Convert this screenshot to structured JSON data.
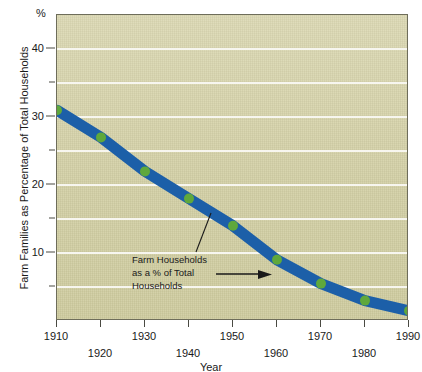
{
  "chart_data": {
    "type": "line",
    "title": "",
    "xlabel": "Year",
    "ylabel": "Farm Families as Percentage of Total Households",
    "unit_label": "%",
    "xlim": [
      1910,
      1990
    ],
    "ylim": [
      0,
      45
    ],
    "grid": true,
    "grid_values": [
      5,
      10,
      15,
      20,
      25,
      30,
      35,
      40
    ],
    "legend_position": "none",
    "x": [
      1910,
      1920,
      1930,
      1940,
      1950,
      1960,
      1970,
      1980,
      1990
    ],
    "series": [
      {
        "name": "Farm Households as a % of Total Households",
        "values": [
          31,
          27,
          22,
          18,
          14,
          9,
          5.5,
          3,
          1.5
        ],
        "line_color": "#1c5fa8",
        "marker_color": "#5fa83c"
      }
    ],
    "y_ticks_major": [
      10,
      20,
      30,
      40
    ],
    "y_ticks_minor": [
      5,
      15,
      25,
      35
    ],
    "y_tick_labels": [
      "10",
      "20",
      "30",
      "40"
    ],
    "x_ticks": [
      1910,
      1920,
      1930,
      1940,
      1950,
      1960,
      1970,
      1980,
      1990
    ],
    "x_tick_labels": [
      "1910",
      "1920",
      "1930",
      "1940",
      "1950",
      "1960",
      "1970",
      "1980",
      "1990"
    ],
    "annotations": [
      {
        "text_lines": [
          "Farm Households",
          "as a % of Total",
          "Households"
        ],
        "arrow": "right-arrow"
      }
    ]
  },
  "axes": {
    "y_title": "Farm Families as Percentage of Total Households",
    "y_unit": "%",
    "x_title": "Year"
  },
  "annotation": {
    "line1": "Farm Households",
    "line2": "as a % of Total",
    "line3": "Households"
  },
  "colors": {
    "plot_background": "#d6d3ab",
    "gridline": "#f7f6ef",
    "line": "#1c5fa8",
    "marker": "#5fa83c",
    "frame": "#6e6d5a",
    "text": "#1a1a1a"
  }
}
